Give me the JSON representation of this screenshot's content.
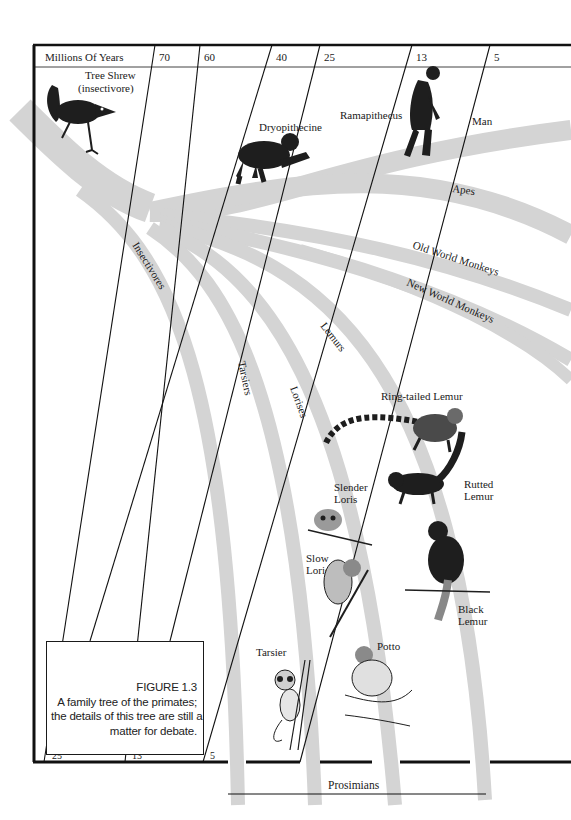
{
  "figure": {
    "number": "FIGURE 1.3",
    "caption_lines": [
      "A family tree of the primates;",
      "the details of this tree are still a",
      "matter for debate."
    ]
  },
  "timeline": {
    "header_label": "Millions Of Years",
    "top_ticks": [
      "70",
      "60",
      "40",
      "25",
      "13",
      "5"
    ],
    "bottom_ticks": [
      "25",
      "13",
      "5"
    ]
  },
  "lineages": {
    "man": "Man",
    "apes": "Apes",
    "old_world_monkeys": "Old World Monkeys",
    "new_world_monkeys": "New World Monkeys",
    "insectivores": "Insectivores",
    "tarsiers": "Tarsiers",
    "lorises": "Lorises",
    "lemurs": "Lemurs",
    "prosimians": "Prosimians"
  },
  "animals": {
    "tree_shrew": [
      "Tree Shrew",
      "(insectivore)"
    ],
    "dryopithecine": "Dryopithecine",
    "ramapithecus": "Ramapithecus",
    "ring_tailed_lemur": "Ring-tailed Lemur",
    "rutted_lemur": [
      "Rutted",
      "Lemur"
    ],
    "slender_loris": [
      "Slender",
      "Loris"
    ],
    "slow_loris": [
      "Slow",
      "Loris"
    ],
    "black_lemur": [
      "Black",
      "Lemur"
    ],
    "tarsier": "Tarsier",
    "potto": "Potto"
  },
  "colors": {
    "band": "#d4d4d4",
    "ink": "#1a1a1a",
    "paper": "#ffffff"
  }
}
